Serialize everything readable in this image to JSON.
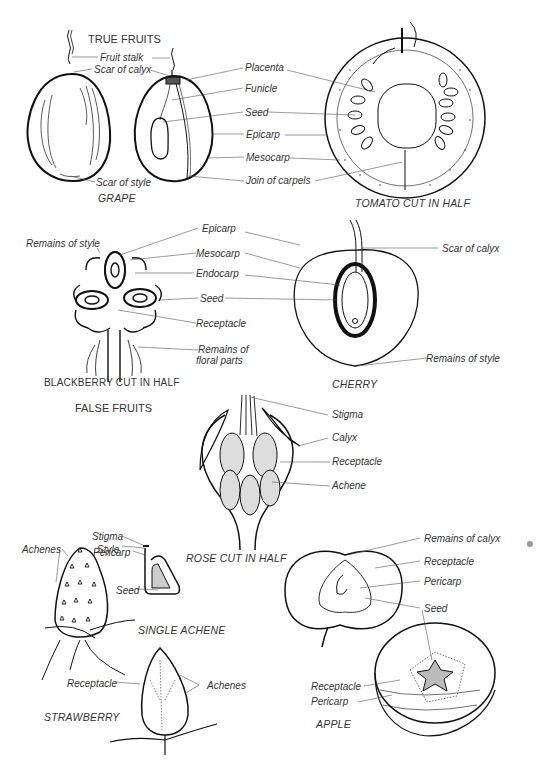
{
  "headings": {
    "true_fruits": "TRUE FRUITS",
    "false_fruits": "FALSE FRUITS"
  },
  "grape": {
    "caption": "GRAPE",
    "labels": {
      "fruit_stalk": "Fruit stalk",
      "scar_of_calyx": "Scar of calyx",
      "scar_of_style": "Scar of style"
    }
  },
  "tomato": {
    "caption": "TOMATO CUT IN HALF",
    "labels": {
      "placenta": "Placenta",
      "funicle": "Funicle",
      "seed": "Seed",
      "epicarp": "Epicarp",
      "mesocarp": "Mesocarp",
      "join_of_carpels": "Join of carpels"
    }
  },
  "blackberry": {
    "caption": "BLACKBERRY CUT IN HALF",
    "labels": {
      "remains_of_style": "Remains of style",
      "epicarp": "Epicarp",
      "mesocarp": "Mesocarp",
      "endocarp": "Endocarp",
      "seed": "Seed",
      "receptacle": "Receptacle",
      "remains_of_floral_1": "Remains of",
      "remains_of_floral_2": "floral parts"
    }
  },
  "cherry": {
    "caption": "CHERRY",
    "labels": {
      "scar_of_calyx": "Scar of calyx",
      "remains_of_style": "Remains of style"
    }
  },
  "rose": {
    "caption": "ROSE CUT IN HALF",
    "labels": {
      "stigma": "Stigma",
      "calyx": "Calyx",
      "receptacle": "Receptacle",
      "achene": "Achene"
    }
  },
  "single_achene": {
    "caption": "SINGLE ACHENE",
    "labels": {
      "stigma": "Stigma",
      "style": "Style",
      "pericarp": "Pericarp",
      "seed": "Seed"
    }
  },
  "strawberry": {
    "caption": "STRAWBERRY",
    "labels": {
      "achenes_top": "Achenes",
      "receptacle": "Receptacle",
      "achenes": "Achenes"
    }
  },
  "apple": {
    "caption": "APPLE",
    "labels": {
      "remains_of_calyx": "Remains of calyx",
      "receptacle": "Receptacle",
      "pericarp": "Pericarp",
      "seed": "Seed",
      "receptacle_2": "Receptacle",
      "pericarp_2": "Pericarp"
    }
  }
}
